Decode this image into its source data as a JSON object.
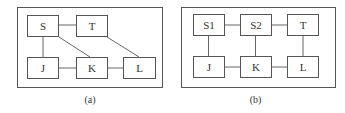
{
  "panels": [
    {
      "caption": "(a)",
      "nodes": [
        {
          "id": "S",
          "label": "S"
        },
        {
          "id": "T",
          "label": "T"
        },
        {
          "id": "J",
          "label": "J"
        },
        {
          "id": "K",
          "label": "K"
        },
        {
          "id": "L",
          "label": "L"
        }
      ],
      "edges": [
        [
          "S",
          "T"
        ],
        [
          "S",
          "J"
        ],
        [
          "S",
          "K"
        ],
        [
          "T",
          "L"
        ],
        [
          "J",
          "K"
        ],
        [
          "K",
          "L"
        ]
      ]
    },
    {
      "caption": "(b)",
      "nodes": [
        {
          "id": "S1",
          "label": "S1"
        },
        {
          "id": "S2",
          "label": "S2"
        },
        {
          "id": "T",
          "label": "T"
        },
        {
          "id": "J",
          "label": "J"
        },
        {
          "id": "K",
          "label": "K"
        },
        {
          "id": "L",
          "label": "L"
        }
      ],
      "edges": [
        [
          "S1",
          "S2"
        ],
        [
          "S2",
          "T"
        ],
        [
          "S1",
          "J"
        ],
        [
          "S2",
          "K"
        ],
        [
          "T",
          "L"
        ],
        [
          "J",
          "K"
        ],
        [
          "K",
          "L"
        ]
      ]
    }
  ]
}
